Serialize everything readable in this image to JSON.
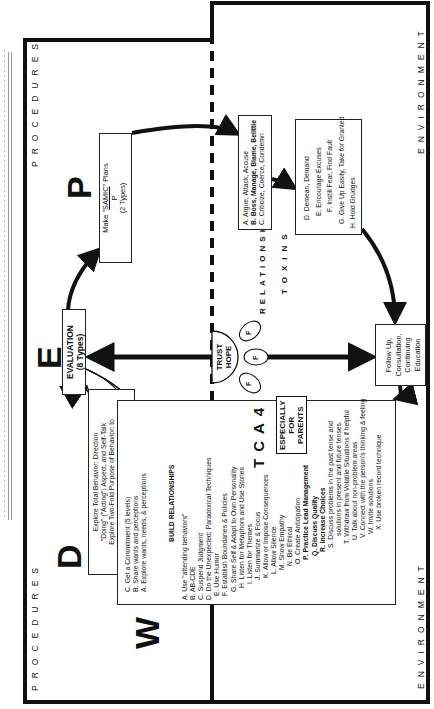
{
  "labels": {
    "procedures": "PROCEDURES",
    "environment": "ENVIRONMENT",
    "relationships": "RELATIONSHIPS",
    "toxins": "TOXINS",
    "tonics": "TONICS"
  },
  "big_letters": {
    "w": "W",
    "d": "D",
    "e": "E",
    "p": "P"
  },
  "evaluation_box": {
    "title": "EVALUATION",
    "subtitle": "(8 Types)"
  },
  "plans_box": {
    "line1_prefix": "Make \"",
    "line1_emph": "SAMIC",
    "line1_suffix": "\" Plans",
    "line2": "P",
    "line3": "(2 Types)"
  },
  "direction_box": {
    "lines": [
      "Explore Total Behavior: Direction",
      "\"Doing\" (\"Acting\") Aspect, and Self-Talk",
      "Explore Two-Fold Purpose of Behavior: to",
      "impact the outer world and to communicate",
      "a message to it."
    ]
  },
  "wants_box": {
    "top_items": [
      "C. Get a Commitment (5 levels)",
      "B. Share wants and perceptions",
      "A. Explore wants, needs, & perceptions"
    ],
    "divider_label": "BUILD RELATIONSHIPS",
    "badge_number": "4",
    "badge_letters": [
      "A",
      "C",
      "T"
    ],
    "parents_badge": [
      "ESPECIALLY",
      "FOR",
      "PARENTS"
    ],
    "items": [
      {
        "text": "A. Use \"attending behaviors\"",
        "bold": false
      },
      {
        "text": "B. AB-CDE",
        "bold": false
      },
      {
        "text": "C. Suspend Judgment",
        "bold": false
      },
      {
        "text": "D. Do the Unexpected; Paradoxical Techniques",
        "bold": false
      },
      {
        "text": "E. Use Humor",
        "bold": false
      },
      {
        "text": "F. Establish Boundaries & Policies",
        "bold": false
      },
      {
        "text": "G. Share Self & Adapt to Own Personality",
        "bold": false
      },
      {
        "text": "H. Listen for Metaphors and Use Stories",
        "bold": false
      },
      {
        "text": "I. Listen for Themes",
        "bold": false
      },
      {
        "text": "J. Summarize & Focus",
        "bold": false
      },
      {
        "text": "K. Allow or Impose Consequences",
        "bold": false
      },
      {
        "text": "L. Allow Silence",
        "bold": false
      },
      {
        "text": "M. Show Empathy",
        "bold": false
      },
      {
        "text": "N. Be Ethical",
        "bold": false
      },
      {
        "text": "O. Create Anticipation",
        "bold": false
      },
      {
        "text": "P. Practice Lead Management",
        "bold": true
      },
      {
        "text": "Q. Discuss Quality",
        "bold": true
      },
      {
        "text": "R. Increase Choices",
        "bold": true
      },
      {
        "text": "S. Discuss problems in the past tense and",
        "bold": false
      },
      {
        "text": "solutions in present and future tenses.",
        "bold": false
      },
      {
        "text": "T. Withdraw from Volatile Situations if helpful",
        "bold": false
      },
      {
        "text": "U. Talk about non-problem areas",
        "bold": false
      },
      {
        "text": "V. Connect with the person's thinking & feeling",
        "bold": false
      },
      {
        "text": "W. Invite solutions",
        "bold": false
      },
      {
        "text": "X. Use broken record technique",
        "bold": false
      }
    ]
  },
  "toxins_box1": {
    "items": [
      {
        "text": "A. Argue, Attack, Accuse",
        "bold": false
      },
      {
        "text": "B. Boss, Manage, Blame, Belittle",
        "bold": true
      },
      {
        "text": "C. Criticize, Coerce, Condemn",
        "bold": false
      }
    ]
  },
  "toxins_box2": {
    "items": [
      "D. Demean, Demand",
      "E. Encourage Excuses",
      "F. Instill Fear, Find Fault",
      "G. Give Up Easily, Take for Granted",
      "H. Hold Grudges"
    ]
  },
  "followup_box": {
    "lines": [
      "Follow Up,",
      "Consultation,",
      "Continuing",
      "Education"
    ]
  },
  "trust_hope": {
    "lines": [
      "TRUST",
      "HOPE"
    ],
    "petals": [
      "F",
      "F",
      "F"
    ]
  }
}
